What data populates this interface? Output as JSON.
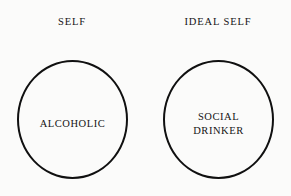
{
  "diagram": {
    "type": "two-circle-concept-diagram",
    "background_color": "#fbfbfa",
    "stroke_color": "#101010",
    "text_color": "#141414",
    "columns": [
      {
        "heading": "SELF",
        "circle_label": "ALCOHOLIC"
      },
      {
        "heading": "IDEAL SELF",
        "circle_label": "SOCIAL\nDRINKER"
      }
    ]
  }
}
